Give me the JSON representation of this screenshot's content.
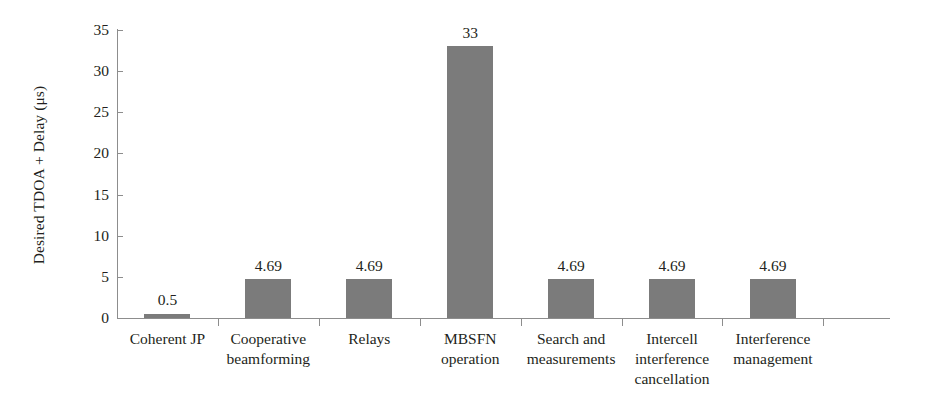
{
  "chart_data": {
    "type": "bar",
    "title": "",
    "xlabel": "",
    "ylabel": "Desired TDOA + Delay (μs)",
    "categories": [
      "Coherent JP",
      "Cooperative beamforming",
      "Relays",
      "MBSFN operation",
      "Search and measurements",
      "Intercell interference cancellation",
      "Interference management"
    ],
    "category_lines": [
      [
        "Coherent JP"
      ],
      [
        "Cooperative",
        "beamforming"
      ],
      [
        "Relays"
      ],
      [
        "MBSFN",
        "operation"
      ],
      [
        "Search and",
        "measurements"
      ],
      [
        "Intercell",
        "interference",
        "cancellation"
      ],
      [
        "Interference",
        "management"
      ]
    ],
    "values": [
      0.5,
      4.69,
      4.69,
      33,
      4.69,
      4.69,
      4.69
    ],
    "value_labels": [
      "0.5",
      "4.69",
      "4.69",
      "33",
      "4.69",
      "4.69",
      "4.69"
    ],
    "ylim": [
      0,
      35
    ],
    "ytick_values": [
      0,
      5,
      10,
      15,
      20,
      25,
      30,
      35
    ],
    "ytick_labels": [
      "0",
      "5",
      "10",
      "15",
      "20",
      "25",
      "30",
      "35"
    ],
    "grid": false,
    "legend": false,
    "bar_color": "#7b7b7b",
    "axis_color": "#8d8d8d",
    "text_color": "#231f20",
    "background_color": "#ffffff"
  }
}
